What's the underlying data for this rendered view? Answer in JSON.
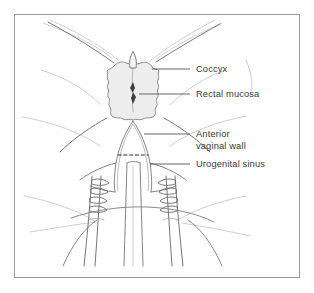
{
  "figure": {
    "frame": {
      "border_color": "#9a9a9a",
      "background_color": "#ffffff"
    },
    "palette": {
      "outline": "#6e6e6e",
      "faint_outline": "#c2c2c2",
      "tissue_fill": "#ededed",
      "tissue_stroke": "#8a8a8a",
      "slit_fill": "#3d3d3d",
      "leader_line": "#555555",
      "label_text": "#3a3a3a",
      "dashed_line": "#2b2b2b"
    },
    "labels": [
      {
        "id": "coccyx",
        "text": "Coccyx",
        "lines": [
          "Coccyx"
        ],
        "x": 196,
        "y": 72,
        "leader": {
          "x1": 190,
          "y1": 69,
          "x2": 152,
          "y2": 69
        }
      },
      {
        "id": "rectal-mucosa",
        "text": "Rectal mucosa",
        "lines": [
          "Rectal mucosa"
        ],
        "x": 196,
        "y": 97,
        "leader": {
          "x1": 190,
          "y1": 94,
          "x2": 139,
          "y2": 94
        }
      },
      {
        "id": "anterior-vaginal-wall",
        "text": "Anterior vaginal wall",
        "lines": [
          "Anterior",
          "vaginal wall"
        ],
        "x": 196,
        "y": 137,
        "line_height": 12,
        "leader": {
          "x1": 190,
          "y1": 134,
          "x2": 144,
          "y2": 134
        }
      },
      {
        "id": "urogenital-sinus",
        "text": "Urogenital sinus",
        "lines": [
          "Urogenital sinus"
        ],
        "x": 196,
        "y": 167,
        "leader": {
          "x1": 190,
          "y1": 164,
          "x2": 150,
          "y2": 164
        }
      }
    ],
    "structures": [
      {
        "id": "coccyx-tip",
        "name": "Coccyx bone tip"
      },
      {
        "id": "rectal-mucosa-sheet",
        "name": "Everted rectal mucosa"
      },
      {
        "id": "rectal-slit",
        "name": "Rectal lumen slit"
      },
      {
        "id": "anterior-vaginal-wall-funnel",
        "name": "Anterior vaginal wall"
      },
      {
        "id": "urogenital-sinus-tube",
        "name": "Urogenital sinus"
      },
      {
        "id": "dashed-marker",
        "name": "Dashed reference line"
      },
      {
        "id": "retractor-left",
        "name": "Left retractor blade"
      },
      {
        "id": "retractor-right",
        "name": "Right retractor blade"
      },
      {
        "id": "instrument-shafts",
        "name": "Instrument shafts"
      },
      {
        "id": "buttock-contours",
        "name": "Buttock and thigh contours"
      }
    ]
  }
}
